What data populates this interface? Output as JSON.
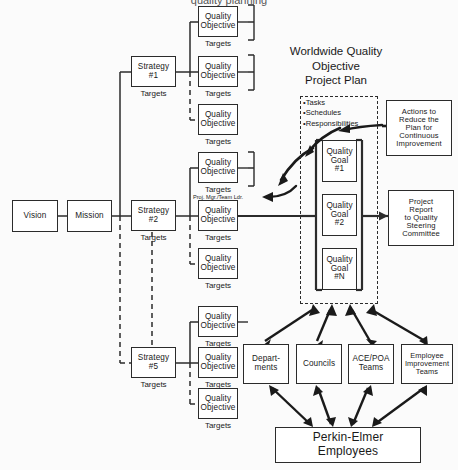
{
  "diagram": {
    "title": "Worldwide Quality Objective Project Plan",
    "title_lines": [
      "Worldwide Quality",
      "Objective",
      "Project Plan"
    ],
    "clipped_header": "quality planning"
  },
  "chain": {
    "vision": "Vision",
    "mission": "Mission"
  },
  "strategies": [
    {
      "label_lines": [
        "Strategy",
        "#1"
      ],
      "name": "Strategy #1",
      "caption": "Targets"
    },
    {
      "label_lines": [
        "Strategy",
        "#2"
      ],
      "name": "Strategy #2",
      "caption": "Targets"
    },
    {
      "label_lines": [
        "Strategy",
        "#5"
      ],
      "name": "Strategy #5",
      "caption": "Targets"
    }
  ],
  "objective": {
    "label_lines": [
      "Quality",
      "Objective"
    ],
    "name": "Quality Objective",
    "caption": "Targets"
  },
  "objectives_groups": [
    {
      "strategy": "Strategy #1",
      "count": 3
    },
    {
      "strategy": "Strategy #2",
      "count": 3
    },
    {
      "strategy": "Strategy #5",
      "count": 3
    }
  ],
  "annotations": {
    "proj_mgr": "Proj. Mgr./Team Ldr."
  },
  "plan_panel": {
    "bullets": [
      "•Tasks",
      "•Schedules",
      "•Responsibilities"
    ]
  },
  "goals": [
    {
      "label_lines": [
        "Quality",
        "Goal",
        "#1"
      ],
      "name": "Quality Goal #1"
    },
    {
      "label_lines": [
        "Quality",
        "Goal",
        "#2"
      ],
      "name": "Quality Goal #2"
    },
    {
      "label_lines": [
        "Quality",
        "Goal",
        "#N"
      ],
      "name": "Quality Goal #N"
    }
  ],
  "side_boxes": {
    "actions": {
      "lines": [
        "Actions to",
        "Reduce the",
        "Plan for",
        "Continuous",
        "Improvement"
      ],
      "name": "Actions to Reduce the Plan for Continuous Improvement"
    },
    "report": {
      "lines": [
        "Project",
        "Report",
        "to Quality",
        "Steering",
        "Committee"
      ],
      "name": "Project Report to Quality Steering Committee"
    }
  },
  "org_boxes": [
    {
      "lines": [
        "Depart-",
        "ments"
      ],
      "name": "Departments"
    },
    {
      "lines": [
        "Councils"
      ],
      "name": "Councils"
    },
    {
      "lines": [
        "ACE/POA",
        "Teams"
      ],
      "name": "ACE/POA Teams"
    },
    {
      "lines": [
        "Employee",
        "Improvement",
        "Teams"
      ],
      "name": "Employee Improvement Teams"
    }
  ],
  "employees": {
    "lines": [
      "Perkin-Elmer",
      "Employees"
    ],
    "name": "Perkin-Elmer Employees"
  },
  "colors": {
    "stroke": "#2b2b2b",
    "fill": "#ffffff",
    "background": "#fbfbfb"
  }
}
